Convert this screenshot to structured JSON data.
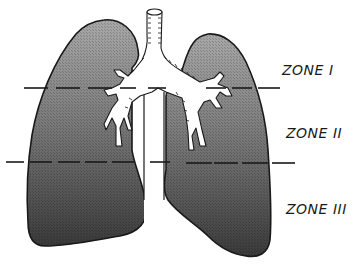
{
  "diagram": {
    "zones": [
      {
        "label": "ZONE I"
      },
      {
        "label": "ZONE II"
      },
      {
        "label": "ZONE III"
      }
    ],
    "colors": {
      "lung_top": "#9a9a9a",
      "lung_bottom": "#3c3c3c",
      "outline": "#1a1a1a",
      "airway": "#ffffff",
      "background": "#ffffff"
    }
  }
}
